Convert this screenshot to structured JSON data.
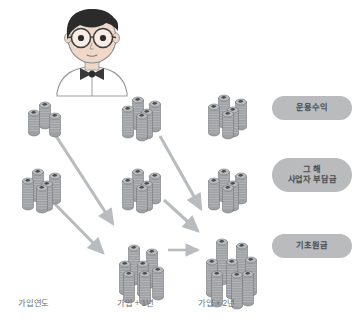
{
  "diagram": {
    "character": {
      "name": "안경 냀 캐릭터",
      "hair_color": "#2b2b2b",
      "skin_color": "#f0d8c8",
      "bowtie_color": "#3a3a3a",
      "outline_color": "#8a8d90"
    },
    "palette": {
      "coin_light": "#b9bcbe",
      "coin_mid": "#9ea1a4",
      "coin_dark": "#808386",
      "coin_edge": "#6c6f72",
      "coin_mark": "#4b4e51",
      "arrow": "#b9bcbe",
      "pill_bg": "#b9bbbd",
      "pill_text": "#4a4d50",
      "axis_text": "#6f7275",
      "background": "#ffffff"
    },
    "legend": {
      "items": [
        {
          "id": "yield",
          "label": "운용수익",
          "row": "top"
        },
        {
          "id": "employer",
          "label": "그 해\n사업자 부담금",
          "row": "middle"
        },
        {
          "id": "principal",
          "label": "기초원금",
          "row": "bottom"
        }
      ]
    },
    "axis": {
      "labels": [
        {
          "id": "year0",
          "label": "가입연도"
        },
        {
          "id": "year1",
          "label": "가입 + 1년"
        },
        {
          "id": "year2",
          "label": "가입 + 2년"
        }
      ]
    },
    "columns": [
      {
        "id": "year0",
        "label": "가입연도",
        "stacks": [
          {
            "row": "top",
            "category": "운용수익",
            "coin_piles": 3,
            "size": "small"
          },
          {
            "row": "middle",
            "category": "사업자 부담금",
            "coin_piles": 5,
            "size": "medium"
          }
        ]
      },
      {
        "id": "year1",
        "label": "가입 + 1년",
        "stacks": [
          {
            "row": "top",
            "category": "운용수익",
            "coin_piles": 5,
            "size": "medium"
          },
          {
            "row": "middle",
            "category": "사업자 부담금",
            "coin_piles": 5,
            "size": "medium"
          },
          {
            "row": "bottom",
            "category": "기초원금",
            "coin_piles": 7,
            "size": "large"
          }
        ]
      },
      {
        "id": "year2",
        "label": "가입 + 2년",
        "stacks": [
          {
            "row": "top",
            "category": "운용수익",
            "coin_piles": 5,
            "size": "medium"
          },
          {
            "row": "middle",
            "category": "사업자 부담금",
            "coin_piles": 5,
            "size": "medium"
          },
          {
            "row": "bottom",
            "category": "기초원금",
            "coin_piles": 8,
            "size": "xlarge"
          }
        ]
      }
    ],
    "arrows": [
      {
        "id": "y0-top-to-y1-bottom",
        "from": "year0.top",
        "to": "year1.bottom",
        "direction": "diagonal-down-right"
      },
      {
        "id": "y0-middle-to-y1-bottom",
        "from": "year0.middle",
        "to": "year1.bottom",
        "direction": "diagonal-down-right"
      },
      {
        "id": "y1-top-to-y2-bottom",
        "from": "year1.top",
        "to": "year2.bottom",
        "direction": "diagonal-down-right"
      },
      {
        "id": "y1-middle-to-y2-bottom",
        "from": "year1.middle",
        "to": "year2.bottom",
        "direction": "diagonal-down-right"
      },
      {
        "id": "y1-bottom-to-y2-bottom",
        "from": "year1.bottom",
        "to": "year2.bottom",
        "direction": "horizontal-right"
      }
    ]
  }
}
